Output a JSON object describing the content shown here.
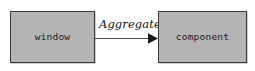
{
  "diagram": {
    "type": "uml-class-relationship",
    "background_color": "#fdfdfd",
    "nodes": [
      {
        "id": "window",
        "label": "window",
        "fill_color": "#b4b4b4",
        "border_color": "#3a3a3a"
      },
      {
        "id": "component",
        "label": "component",
        "fill_color": "#b4b4b4",
        "border_color": "#3a3a3a"
      }
    ],
    "edges": [
      {
        "id": "aggregate",
        "label": "Aggregate",
        "from": "window",
        "to": "component",
        "arrowhead": "solid-filled-triangle",
        "line_color": "#4a4a4a",
        "direction": "right"
      }
    ]
  }
}
